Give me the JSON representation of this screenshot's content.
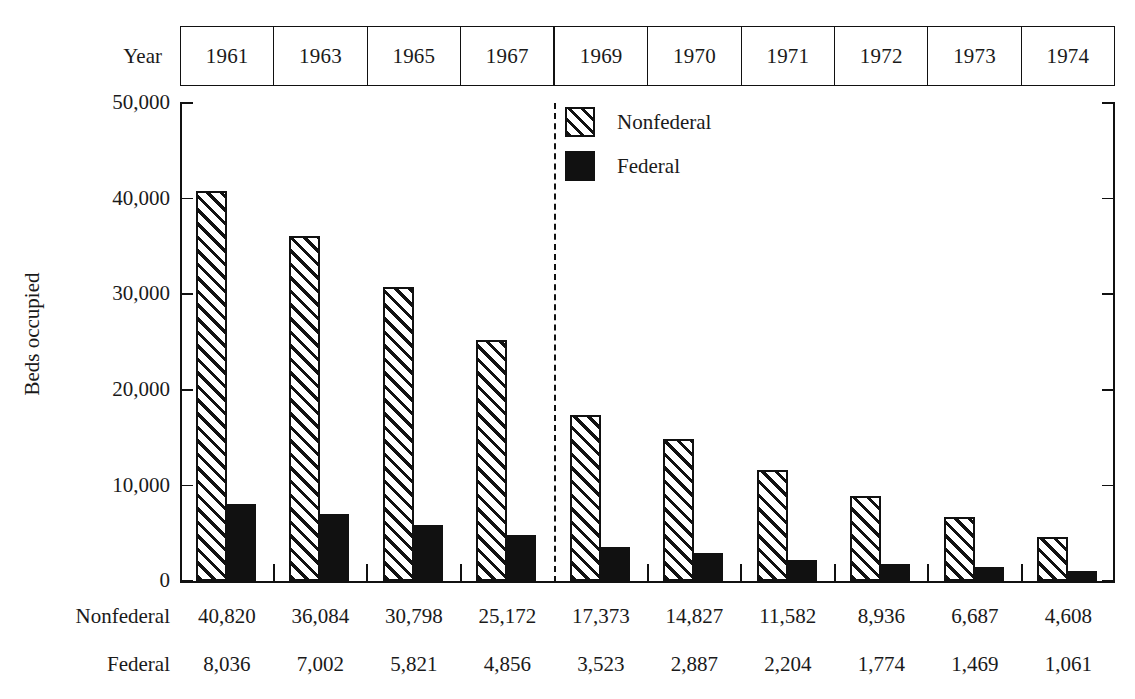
{
  "axis": {
    "year_label": "Year",
    "ylabel": "Beds occupied",
    "yticks": [
      "50,000",
      "40,000",
      "30,000",
      "20,000",
      "10,000",
      "0"
    ]
  },
  "legend": {
    "items": [
      {
        "label": "Nonfederal",
        "swatch": "hatched-diagonal",
        "color": "#111111"
      },
      {
        "label": "Federal",
        "swatch": "solid-black",
        "color": "#111111"
      }
    ]
  },
  "rows": {
    "nonfederal_label": "Nonfederal",
    "federal_label": "Federal"
  },
  "chart_data": {
    "type": "bar",
    "title": "",
    "xlabel": "Year",
    "ylabel": "Beds occupied",
    "ylim": [
      0,
      50000
    ],
    "ytick_values": [
      0,
      10000,
      20000,
      30000,
      40000,
      50000
    ],
    "grid": false,
    "legend_position": "top-center",
    "categories": [
      "1961",
      "1963",
      "1965",
      "1967",
      "1969",
      "1970",
      "1971",
      "1972",
      "1973",
      "1974"
    ],
    "group_break_after": "1967",
    "series": [
      {
        "name": "Nonfederal",
        "style": "hatched",
        "values": [
          40820,
          36084,
          30798,
          25172,
          17373,
          14827,
          11582,
          8936,
          6687,
          4608
        ],
        "labels": [
          "40,820",
          "36,084",
          "30,798",
          "25,172",
          "17,373",
          "14,827",
          "11,582",
          "8,936",
          "6,687",
          "4,608"
        ]
      },
      {
        "name": "Federal",
        "style": "solid",
        "values": [
          8036,
          7002,
          5821,
          4856,
          3523,
          2887,
          2204,
          1774,
          1469,
          1061
        ],
        "labels": [
          "8,036",
          "7,002",
          "5,821",
          "4,856",
          "3,523",
          "2,887",
          "2,204",
          "1,774",
          "1,469",
          "1,061"
        ]
      }
    ]
  }
}
